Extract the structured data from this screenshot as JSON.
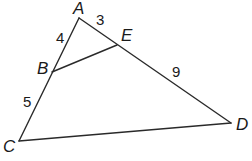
{
  "diagram": {
    "type": "triangle-with-segment",
    "vertices": {
      "A": {
        "label": "A",
        "x": 79,
        "y": 18
      },
      "B": {
        "label": "B",
        "x": 52,
        "y": 72
      },
      "C": {
        "label": "C",
        "x": 19,
        "y": 141
      },
      "D": {
        "label": "D",
        "x": 231,
        "y": 123
      },
      "E": {
        "label": "E",
        "x": 117,
        "y": 45
      }
    },
    "segments": [
      {
        "from": "A",
        "to": "C"
      },
      {
        "from": "A",
        "to": "D"
      },
      {
        "from": "C",
        "to": "D"
      },
      {
        "from": "B",
        "to": "E"
      }
    ],
    "lengths": {
      "AB": "4",
      "AE": "3",
      "BC": "5",
      "ED": "9"
    },
    "line_color": "#2a2a2a"
  }
}
